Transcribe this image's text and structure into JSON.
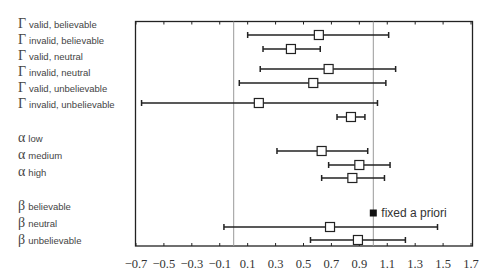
{
  "chart_data": {
    "type": "forest",
    "title": "",
    "xlabel": "",
    "ylabel": "",
    "xlim": [
      -0.7,
      1.7
    ],
    "xticks": [
      -0.7,
      -0.5,
      -0.3,
      -0.1,
      0.1,
      0.3,
      0.5,
      0.7,
      0.9,
      1.1,
      1.3,
      1.5,
      1.7
    ],
    "xtick_labels": [
      "−0.7",
      "−0.5",
      "−0.3",
      "−0.1",
      "0.1",
      "0.3",
      "0.5",
      "0.7",
      "0.9",
      "1.1",
      "1.3",
      "1.5",
      "1.7"
    ],
    "reference_lines": [
      0,
      1
    ],
    "grid": false,
    "groups": [
      {
        "symbol": "Γ",
        "rows": [
          {
            "label": "valid, believable",
            "estimate": 0.61,
            "lower": 0.1,
            "upper": 1.11
          },
          {
            "label": "invalid, believable",
            "estimate": 0.41,
            "lower": 0.21,
            "upper": 0.62
          },
          {
            "label": "valid, neutral",
            "estimate": 0.68,
            "lower": 0.19,
            "upper": 1.16
          },
          {
            "label": "invalid, neutral",
            "estimate": 0.57,
            "lower": 0.04,
            "upper": 1.09
          },
          {
            "label": "valid, unbelievable",
            "estimate": 0.18,
            "lower": -0.66,
            "upper": 1.03
          },
          {
            "label": "invalid, unbelievable",
            "estimate": 0.84,
            "lower": 0.74,
            "upper": 0.94
          }
        ]
      },
      {
        "symbol": "α",
        "rows": [
          {
            "label": "low",
            "estimate": 0.63,
            "lower": 0.31,
            "upper": 0.96
          },
          {
            "label": "medium",
            "estimate": 0.9,
            "lower": 0.68,
            "upper": 1.12
          },
          {
            "label": "high",
            "estimate": 0.85,
            "lower": 0.63,
            "upper": 1.08
          }
        ]
      },
      {
        "symbol": "β",
        "rows": [
          {
            "label": "believable",
            "estimate": 1.0,
            "lower": null,
            "upper": null,
            "fixed": true
          },
          {
            "label": "neutral",
            "estimate": 0.69,
            "lower": -0.07,
            "upper": 1.46
          },
          {
            "label": "unbelievable",
            "estimate": 0.89,
            "lower": 0.55,
            "upper": 1.23
          }
        ]
      }
    ],
    "annotations": [
      {
        "text": "fixed a priori",
        "x": 1.0,
        "row": "β believable"
      }
    ]
  },
  "labels": {
    "gamma": "Γ",
    "alpha": "α",
    "beta": "β",
    "r1": "valid, believable",
    "r2": "invalid, believable",
    "r3": "valid, neutral",
    "r4": "invalid, neutral",
    "r5": "valid, unbelievable",
    "r6": "invalid, unbelievable",
    "a1": "low",
    "a2": "medium",
    "a3": "high",
    "b1": "believable",
    "b2": "neutral",
    "b3": "unbelievable"
  },
  "annotation_text": "fixed a priori",
  "colors": {
    "line": "#222222",
    "refline": "#999999",
    "box_fill": "#ffffff",
    "text": "#333333"
  }
}
